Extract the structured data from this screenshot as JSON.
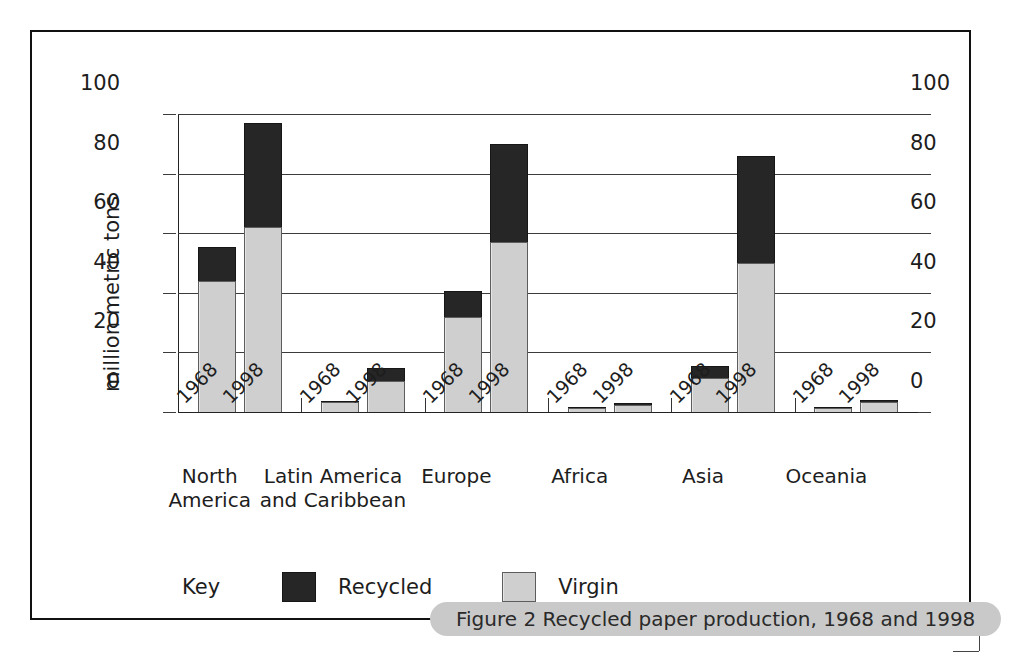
{
  "figure": {
    "caption": "Figure 2 Recycled paper production, 1968 and 1998"
  },
  "legend": {
    "key_label": "Key",
    "items": [
      {
        "label": "Recycled",
        "color": "#262626"
      },
      {
        "label": "Virgin",
        "color": "#cfcfcf"
      }
    ]
  },
  "chart_data": {
    "type": "bar",
    "subtype": "stacked-grouped",
    "title": "Figure 2 Recycled paper production, 1968 and 1998",
    "xlabel": "",
    "ylabel": "million metric tons",
    "ylim": [
      0,
      100
    ],
    "yticks": [
      0,
      20,
      40,
      60,
      80,
      100
    ],
    "ytick_labels": [
      "0",
      "20",
      "40",
      "60",
      "80",
      "100"
    ],
    "right_axis_ticks": [
      "0",
      "20",
      "40",
      "60",
      "80",
      "100"
    ],
    "grid": true,
    "legend_position": "bottom-left",
    "groups": [
      "North America",
      "Latin America and Caribbean",
      "Europe",
      "Africa",
      "Asia",
      "Oceania"
    ],
    "group_labels_multiline": [
      "North\nAmerica",
      "Latin America\nand Caribbean",
      "Europe",
      "Africa",
      "Asia",
      "Oceania"
    ],
    "subcategories": [
      "1968",
      "1998"
    ],
    "series": [
      {
        "name": "Virgin",
        "color": "#cfcfcf",
        "values": [
          {
            "group": "North America",
            "year": "1968",
            "value": 44
          },
          {
            "group": "North America",
            "year": "1998",
            "value": 62
          },
          {
            "group": "Latin America and Caribbean",
            "year": "1968",
            "value": 3.2
          },
          {
            "group": "Latin America and Caribbean",
            "year": "1998",
            "value": 10.5
          },
          {
            "group": "Europe",
            "year": "1968",
            "value": 32
          },
          {
            "group": "Europe",
            "year": "1998",
            "value": 57
          },
          {
            "group": "Africa",
            "year": "1968",
            "value": 1.4
          },
          {
            "group": "Africa",
            "year": "1998",
            "value": 2.2
          },
          {
            "group": "Asia",
            "year": "1968",
            "value": 11.5
          },
          {
            "group": "Asia",
            "year": "1998",
            "value": 50
          },
          {
            "group": "Oceania",
            "year": "1968",
            "value": 1.3
          },
          {
            "group": "Oceania",
            "year": "1998",
            "value": 3.2
          }
        ]
      },
      {
        "name": "Recycled",
        "color": "#262626",
        "values": [
          {
            "group": "North America",
            "year": "1968",
            "value": 11.5
          },
          {
            "group": "North America",
            "year": "1998",
            "value": 35
          },
          {
            "group": "Latin America and Caribbean",
            "year": "1968",
            "value": 0.6
          },
          {
            "group": "Latin America and Caribbean",
            "year": "1998",
            "value": 4.2
          },
          {
            "group": "Europe",
            "year": "1968",
            "value": 8.5
          },
          {
            "group": "Europe",
            "year": "1998",
            "value": 33
          },
          {
            "group": "Africa",
            "year": "1968",
            "value": 0.4
          },
          {
            "group": "Africa",
            "year": "1998",
            "value": 0.9
          },
          {
            "group": "Asia",
            "year": "1968",
            "value": 4
          },
          {
            "group": "Asia",
            "year": "1998",
            "value": 36
          },
          {
            "group": "Oceania",
            "year": "1968",
            "value": 0.3
          },
          {
            "group": "Oceania",
            "year": "1998",
            "value": 0.9
          }
        ]
      }
    ],
    "totals": [
      {
        "group": "North America",
        "year": "1968",
        "total": 55.5
      },
      {
        "group": "North America",
        "year": "1998",
        "total": 97
      },
      {
        "group": "Latin America and Caribbean",
        "year": "1968",
        "total": 3.8
      },
      {
        "group": "Latin America and Caribbean",
        "year": "1998",
        "total": 14.7
      },
      {
        "group": "Europe",
        "year": "1968",
        "total": 40.5
      },
      {
        "group": "Europe",
        "year": "1998",
        "total": 90
      },
      {
        "group": "Africa",
        "year": "1968",
        "total": 1.8
      },
      {
        "group": "Africa",
        "year": "1998",
        "total": 3.1
      },
      {
        "group": "Asia",
        "year": "1968",
        "total": 15.5
      },
      {
        "group": "Asia",
        "year": "1998",
        "total": 86
      },
      {
        "group": "Oceania",
        "year": "1968",
        "total": 1.6
      },
      {
        "group": "Oceania",
        "year": "1998",
        "total": 4.1
      }
    ]
  }
}
